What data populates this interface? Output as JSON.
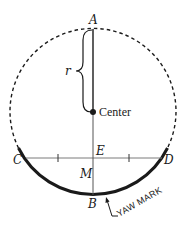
{
  "diagram": {
    "labels": {
      "A": "A",
      "B": "B",
      "C": "C",
      "D": "D",
      "E": "E",
      "M": "M",
      "r": "r",
      "center": "Center",
      "yaw_mark": "YAW MARK"
    },
    "colors": {
      "stroke": "#1a1a1a",
      "chord": "#7a7a7a",
      "background": "#ffffff"
    },
    "geometry": {
      "center": [
        93,
        112
      ],
      "radius": 83,
      "chord_y": 158,
      "tick_x": [
        58,
        129
      ]
    }
  }
}
